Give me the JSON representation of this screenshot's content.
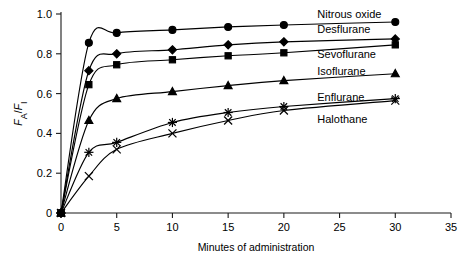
{
  "chart_data": {
    "type": "line",
    "title": "",
    "xlabel": "Minutes of administration",
    "ylabel": "FA/FI",
    "ylabel_parts": {
      "f1": "F",
      "sub1": "A",
      "slash": "/",
      "f2": "F",
      "sub2": "I"
    },
    "xlim": [
      0,
      35
    ],
    "ylim": [
      0,
      1.0
    ],
    "xticks": [
      0,
      5,
      10,
      15,
      20,
      25,
      30,
      35
    ],
    "xtick_labels": [
      "0",
      "5",
      "10",
      "15",
      "20",
      "25",
      "30",
      "35"
    ],
    "yticks": [
      0,
      0.2,
      0.4,
      0.6,
      0.8,
      1.0
    ],
    "ytick_labels": [
      "0",
      "0.2",
      "0.4",
      "0.6",
      "0.8",
      "1.0"
    ],
    "grid": false,
    "legend_position": "inline-right",
    "x": [
      0,
      2.5,
      5,
      10,
      15,
      20,
      30
    ],
    "series": [
      {
        "name": "Nitrous oxide",
        "marker": "filled-circle",
        "values": [
          0,
          0.855,
          0.905,
          0.92,
          0.935,
          0.945,
          0.96
        ],
        "label_x": 23.0,
        "label_y": 1.0
      },
      {
        "name": "Desflurane",
        "marker": "filled-diamond",
        "values": [
          0,
          0.715,
          0.8,
          0.82,
          0.845,
          0.86,
          0.875
        ],
        "label_x": 23.0,
        "label_y": 0.925
      },
      {
        "name": "Sevoflurane",
        "marker": "filled-square",
        "values": [
          0,
          0.645,
          0.745,
          0.77,
          0.79,
          0.805,
          0.845
        ],
        "label_x": 23.0,
        "label_y": 0.8
      },
      {
        "name": "Isoflurane",
        "marker": "filled-triangle",
        "values": [
          0,
          0.465,
          0.575,
          0.61,
          0.64,
          0.665,
          0.7
        ],
        "label_x": 23.0,
        "label_y": 0.715
      },
      {
        "name": "Enflurane",
        "marker": "star",
        "values": [
          0,
          0.305,
          0.355,
          0.455,
          0.505,
          0.535,
          0.575
        ],
        "label_x": 23.0,
        "label_y": 0.585
      },
      {
        "name": "Halothane",
        "marker": "cross-x",
        "values": [
          0,
          0.185,
          0.32,
          0.4,
          0.465,
          0.515,
          0.565
        ],
        "label_x": 23.0,
        "label_y": 0.47
      }
    ]
  }
}
